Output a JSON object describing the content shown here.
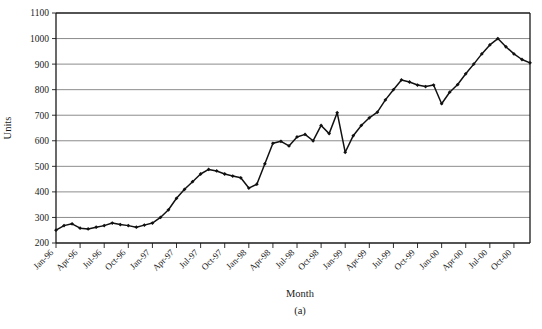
{
  "figure": {
    "caption": "(a)",
    "xlabel": "Month",
    "ylabel": "Units"
  },
  "chart_data": {
    "type": "line",
    "title": "",
    "subtitle": "",
    "xlabel": "Month",
    "ylabel": "Units",
    "ylim": [
      200,
      1100
    ],
    "ytick_step": 100,
    "ytick_labels": [
      "200",
      "300",
      "400",
      "500",
      "600",
      "700",
      "800",
      "900",
      "1000",
      "1100"
    ],
    "ytick_values": [
      200,
      300,
      400,
      500,
      600,
      700,
      800,
      900,
      1000,
      1100
    ],
    "grid": "horizontal",
    "legend": "none",
    "marker": "filled-diamond",
    "line_color": "#111111",
    "grid_color": "#6f6f6f",
    "xtick_labels": [
      "Jan-96",
      "Apr-96",
      "Jul-96",
      "Oct-96",
      "Jan-97",
      "Apr-97",
      "Jul-97",
      "Oct-97",
      "Jan-98",
      "Apr-98",
      "Jul-98",
      "Oct-98",
      "Jan-99",
      "Apr-99",
      "Jul-99",
      "Oct-99",
      "Jan-00",
      "Apr-00",
      "Jul-00",
      "Oct-00"
    ],
    "xtick_interval_months": 3,
    "x": [
      "Jan-96",
      "Feb-96",
      "Mar-96",
      "Apr-96",
      "May-96",
      "Jun-96",
      "Jul-96",
      "Aug-96",
      "Sep-96",
      "Oct-96",
      "Nov-96",
      "Dec-96",
      "Jan-97",
      "Feb-97",
      "Mar-97",
      "Apr-97",
      "May-97",
      "Jun-97",
      "Jul-97",
      "Aug-97",
      "Sep-97",
      "Oct-97",
      "Nov-97",
      "Dec-97",
      "Jan-98",
      "Feb-98",
      "Mar-98",
      "Apr-98",
      "May-98",
      "Jun-98",
      "Jul-98",
      "Aug-98",
      "Sep-98",
      "Oct-98",
      "Nov-98",
      "Dec-98",
      "Jan-99",
      "Feb-99",
      "Mar-99",
      "Apr-99",
      "May-99",
      "Jun-99",
      "Jul-99",
      "Aug-99",
      "Sep-99",
      "Oct-99",
      "Nov-99",
      "Dec-99",
      "Jan-00",
      "Feb-00",
      "Mar-00",
      "Apr-00",
      "May-00",
      "Jun-00",
      "Jul-00",
      "Aug-00",
      "Sep-00",
      "Oct-00",
      "Nov-00",
      "Dec-00"
    ],
    "values": [
      250,
      268,
      275,
      258,
      255,
      262,
      268,
      278,
      272,
      268,
      262,
      270,
      278,
      300,
      330,
      375,
      410,
      440,
      470,
      488,
      482,
      470,
      462,
      455,
      415,
      430,
      510,
      590,
      598,
      580,
      615,
      625,
      600,
      660,
      628,
      710,
      555,
      620,
      660,
      690,
      712,
      760,
      800,
      838,
      830,
      818,
      812,
      818,
      745,
      790,
      820,
      862,
      900,
      940,
      975,
      1000,
      968,
      940,
      918,
      905
    ],
    "series_name": "Units"
  }
}
